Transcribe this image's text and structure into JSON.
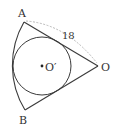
{
  "diagram": {
    "type": "geometry",
    "points": {
      "A": {
        "label": "A",
        "x": 24,
        "y": 22
      },
      "B": {
        "label": "B",
        "x": 25,
        "y": 110
      },
      "O": {
        "label": "O",
        "x": 98,
        "y": 66
      },
      "O_prime": {
        "label": "O′",
        "x": 42,
        "y": 66
      }
    },
    "measurements": {
      "OA_length": "18"
    },
    "inscribed_circle": {
      "cx": 42,
      "cy": 66,
      "r": 29
    },
    "sector": {
      "center": "O",
      "radius_px": 86
    },
    "colors": {
      "stroke": "#3a3a3a",
      "dashed": "#b0b0b0",
      "text": "#333333"
    }
  }
}
